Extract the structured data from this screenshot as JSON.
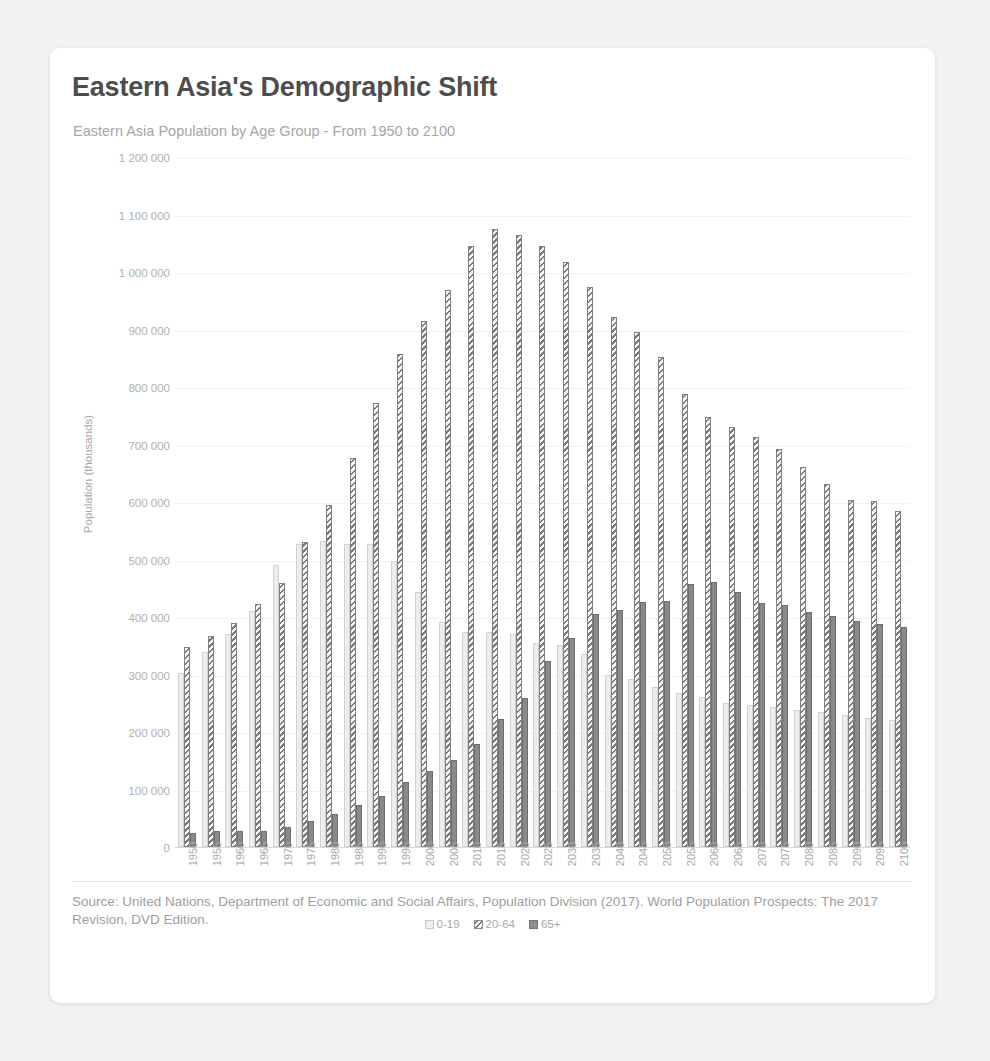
{
  "card": {
    "title": "Eastern Asia's Demographic Shift",
    "subtitle": "Eastern Asia Population by Age Group - From 1950 to 2100",
    "source": "Source: United Nations, Department of Economic and Social Affairs, Population Division (2017). World Population Prospects: The 2017 Revision, DVD Edition."
  },
  "colors": {
    "background": "#f2f2f2",
    "card": "#ffffff",
    "title": "#4d4d4d",
    "subtitle": "#a6a6a6",
    "axis_text": "#a8a8a8",
    "gridline": "#f2f2f2",
    "series_0_19": "#ededed",
    "series_20_64": "#7a7a7a",
    "series_65_plus": "#898989"
  },
  "chart_data": {
    "type": "bar",
    "title": "Eastern Asia's Demographic Shift",
    "subtitle": "Eastern Asia Population by Age Group - From 1950 to 2100",
    "xlabel": "",
    "ylabel": "Population (thousands)",
    "ylim": [
      0,
      1200000
    ],
    "ytick_values": [
      0,
      100000,
      200000,
      300000,
      400000,
      500000,
      600000,
      700000,
      800000,
      900000,
      1000000,
      1100000,
      1200000
    ],
    "ytick_labels": [
      "0",
      "100 000",
      "200 000",
      "300 000",
      "400 000",
      "500 000",
      "600 000",
      "700 000",
      "800 000",
      "900 000",
      "1 000 000",
      "1 100 000",
      "1 200 000"
    ],
    "grid": true,
    "legend_position": "bottom",
    "bar_mode": "grouped",
    "categories": [
      "1950",
      "1955",
      "1960",
      "1965",
      "1970",
      "1975",
      "1980",
      "1985",
      "1990",
      "1995",
      "2000",
      "2005",
      "2010",
      "2015",
      "2020",
      "2025",
      "2030",
      "2035",
      "2040",
      "2045",
      "2050",
      "2055",
      "2060",
      "2065",
      "2070",
      "2075",
      "2080",
      "2085",
      "2090",
      "2095",
      "2100"
    ],
    "series": [
      {
        "name": "0-19",
        "values": [
          303000,
          340000,
          370000,
          410000,
          490000,
          527000,
          532000,
          527000,
          527000,
          497000,
          443000,
          392000,
          374000,
          374000,
          371000,
          355000,
          352000,
          336000,
          300000,
          292000,
          279000,
          267000,
          261000,
          250000,
          247000,
          243000,
          238000,
          235000,
          229000,
          225000,
          221000
        ]
      },
      {
        "name": "20-64",
        "values": [
          348000,
          367000,
          389000,
          422000,
          459000,
          531000,
          594000,
          676000,
          772000,
          858000,
          915000,
          969000,
          1046000,
          1074000,
          1064000,
          1046000,
          1017000,
          974000,
          922000,
          896000,
          853000,
          788000,
          748000,
          731000,
          713000,
          692000,
          661000,
          632000,
          604000,
          602000,
          585000
        ]
      },
      {
        "name": "65+",
        "values": [
          25000,
          28000,
          28000,
          28000,
          35000,
          45000,
          58000,
          73000,
          89000,
          113000,
          133000,
          152000,
          179000,
          222000,
          259000,
          323000,
          363000,
          406000,
          412000,
          426000,
          427000,
          458000,
          461000,
          444000,
          425000,
          421000,
          409000,
          402000,
          393000,
          388000,
          382000
        ]
      }
    ]
  },
  "legend": [
    {
      "label": "0-19",
      "key": "s0"
    },
    {
      "label": "20-64",
      "key": "s1"
    },
    {
      "label": "65+",
      "key": "s2"
    }
  ]
}
